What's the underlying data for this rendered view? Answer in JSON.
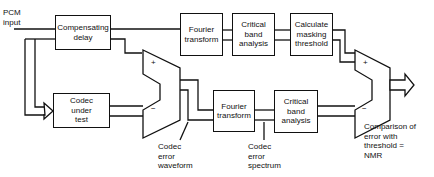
{
  "input": {
    "label": "PCM\ninput"
  },
  "blocks": {
    "comp_delay": "Compensating\ndelay",
    "codec": "Codec\nunder\ntest",
    "fourier_top": "Fourier\ntransform",
    "critical_top": "Critical\nband\nanalysis",
    "masking": "Calculate\nmasking\nthreshold",
    "fourier_bottom": "Fourier\ntransform",
    "critical_bottom": "Critical\nband\nanalysis"
  },
  "subtractors": {
    "first": {
      "plus": "+",
      "minus": "−"
    },
    "second": {
      "plus": "+",
      "minus": "−"
    }
  },
  "annotations": {
    "error_waveform": "Codec\nerror\nwaveform",
    "error_spectrum": "Codec\nerror\nspectrum",
    "comparison": "Comparison of\nerror with\nthreshold =\nNMR"
  }
}
